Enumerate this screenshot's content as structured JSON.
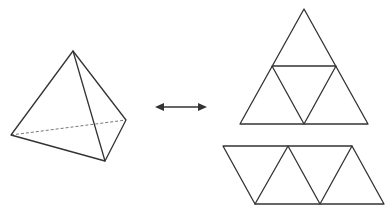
{
  "diagram": {
    "colors": {
      "edge": "#333333",
      "hidden_edge": "#777777",
      "background": "#ffffff"
    },
    "tetrahedron": {
      "label": "",
      "vertices": {
        "apex": [
          73,
          51
        ],
        "left": [
          11,
          135
        ],
        "back_right": [
          126,
          120
        ],
        "front_bottom": [
          105,
          161
        ]
      },
      "visible_edges": [
        [
          "apex",
          "left"
        ],
        [
          "apex",
          "front_bottom"
        ],
        [
          "apex",
          "back_right"
        ],
        [
          "left",
          "front_bottom"
        ],
        [
          "front_bottom",
          "back_right"
        ]
      ],
      "hidden_edges": [
        [
          "left",
          "back_right"
        ]
      ]
    },
    "arrow": {
      "type": "double-headed",
      "from": [
        155,
        107
      ],
      "to": [
        207,
        107
      ]
    },
    "net_triangle": {
      "label": "",
      "faces": 4,
      "outer": [
        [
          304,
          9
        ],
        [
          240,
          124
        ],
        [
          368,
          124
        ]
      ],
      "inner": [
        [
          272,
          66
        ],
        [
          336,
          66
        ],
        [
          304,
          124
        ]
      ]
    },
    "net_strip": {
      "label": "",
      "faces": 4,
      "top_points": [
        [
          223,
          146
        ],
        [
          288,
          146
        ],
        [
          352,
          146
        ]
      ],
      "bottom_points": [
        [
          255,
          204
        ],
        [
          320,
          204
        ],
        [
          384,
          204
        ]
      ]
    }
  }
}
